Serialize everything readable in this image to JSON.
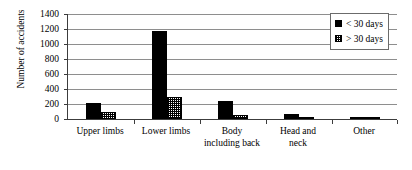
{
  "chart_data": {
    "type": "bar",
    "title": "",
    "xlabel": "",
    "ylabel": "Number of accidents",
    "ylim": [
      0,
      1400
    ],
    "ytick_step": 200,
    "yticks": [
      1400,
      1200,
      1000,
      800,
      600,
      400,
      200,
      0
    ],
    "ytick_labels": [
      "1400",
      "1200",
      "1000",
      "800",
      "600",
      "400",
      "200",
      "0"
    ],
    "grid": true,
    "legend_position": "top-right",
    "categories": [
      "Upper limbs",
      "Lower limbs",
      "Body including back",
      "Head and neck",
      "Other"
    ],
    "category_lines": [
      [
        "Upper limbs"
      ],
      [
        "Lower limbs"
      ],
      [
        "Body",
        "including back"
      ],
      [
        "Head and",
        "neck"
      ],
      [
        "Other"
      ]
    ],
    "series": [
      {
        "name": "< 30 days",
        "color": "#000000",
        "pattern": "solid",
        "values": [
          215,
          1175,
          240,
          65,
          15
        ]
      },
      {
        "name": "> 30 days",
        "color": "#ffffff",
        "pattern": "checkered",
        "values": [
          95,
          290,
          55,
          10,
          5
        ]
      }
    ]
  }
}
